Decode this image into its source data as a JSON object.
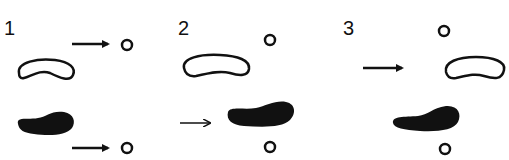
{
  "diagram": {
    "background": "#ffffff",
    "ink": "#111111",
    "panels": [
      {
        "label": "1",
        "description": "Arrows point toward small circles beside the outlined and filled shapes"
      },
      {
        "label": "2",
        "description": "Arrow points at the filled shape; circles above and below"
      },
      {
        "label": "3",
        "description": "Arrow points at the outlined shape; circles above and below the filled shape"
      }
    ]
  }
}
